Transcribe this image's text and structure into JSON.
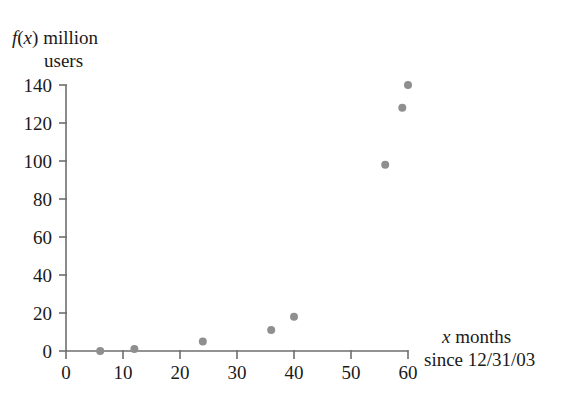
{
  "chart_data": {
    "type": "scatter",
    "title": "",
    "ylabel": "f(x) million users",
    "ylabel_line1": "f(x) million",
    "ylabel_line2": "users",
    "xlabel": "x months since 12/31/03",
    "xlabel_line1": "x months",
    "xlabel_line2": "since 12/31/03",
    "xlim": [
      0,
      60
    ],
    "ylim": [
      0,
      140
    ],
    "xticks": [
      0,
      10,
      20,
      30,
      40,
      50,
      60
    ],
    "yticks": [
      0,
      20,
      40,
      60,
      80,
      100,
      120,
      140
    ],
    "xtick_labels": [
      "0",
      "10",
      "20",
      "30",
      "40",
      "50",
      "60"
    ],
    "ytick_labels": [
      "0",
      "20",
      "40",
      "60",
      "80",
      "100",
      "120",
      "140"
    ],
    "grid": false,
    "legend": false,
    "marker_color": "#8f8f8f",
    "axis_color": "#6e6e6e",
    "points": [
      {
        "x": 6,
        "y": 0
      },
      {
        "x": 12,
        "y": 1
      },
      {
        "x": 24,
        "y": 5
      },
      {
        "x": 36,
        "y": 11
      },
      {
        "x": 40,
        "y": 18
      },
      {
        "x": 56,
        "y": 98
      },
      {
        "x": 59,
        "y": 128
      },
      {
        "x": 60,
        "y": 140
      }
    ],
    "x": [
      6,
      12,
      24,
      36,
      40,
      56,
      59,
      60
    ],
    "values": [
      0,
      1,
      5,
      11,
      18,
      98,
      128,
      140
    ]
  },
  "axis_text": {
    "y_label_part_f": "f",
    "y_label_part_paren_open": "(",
    "y_label_part_x": "x",
    "y_label_part_paren_close": ")",
    "y_label_part_million": "million",
    "y_label_users": "users",
    "x_label_x": "x",
    "x_label_months": "months",
    "x_label_since": "since 12/31/03"
  }
}
